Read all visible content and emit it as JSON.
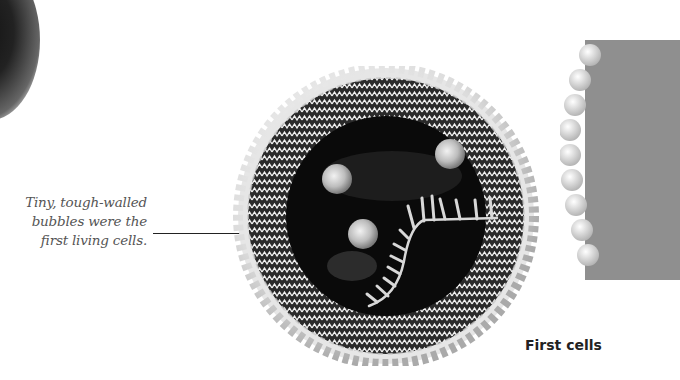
{
  "caption": {
    "line1": "Tiny, tough-walled",
    "line2": "bubbles were the",
    "line3": "first living cells."
  },
  "label": "First cells",
  "illustration": {
    "main": "protocell-illustration",
    "secondary": "membrane-fragment-illustration"
  },
  "colors": {
    "background": "#ffffff",
    "caption_text": "#555555",
    "label_text": "#222222",
    "cell_interior": "#0a0a0a"
  }
}
